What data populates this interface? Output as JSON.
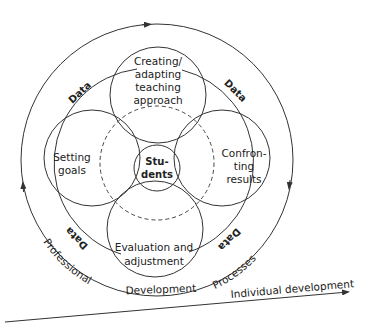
{
  "diagram": {
    "colors": {
      "line": "#333333",
      "text": "#222222",
      "background": "#ffffff"
    },
    "center": {
      "label_line1": "Stu-",
      "label_line2": "dents"
    },
    "nodes": [
      {
        "id": "top",
        "lines": [
          "Creating/",
          "adapting",
          "teaching",
          "approach"
        ]
      },
      {
        "id": "left",
        "lines": [
          "Setting",
          "goals"
        ]
      },
      {
        "id": "right",
        "lines": [
          "Confron-",
          "ting",
          "results"
        ]
      },
      {
        "id": "bottom",
        "lines": [
          "Evaluation and",
          "adjustment"
        ]
      }
    ],
    "data_labels": [
      "Data",
      "Data",
      "Data",
      "Data"
    ],
    "outer_ring_labels": {
      "left": "Professional",
      "bottom": "Development",
      "right": "Processes"
    },
    "axis_label": "Individual development"
  }
}
